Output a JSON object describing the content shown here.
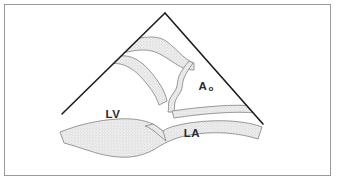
{
  "figure": {
    "kind": "echocardiogram-sector-schematic",
    "background_color": "#ffffff",
    "frame": {
      "border_color": "#9a9a9a",
      "border_width_px": 1,
      "x": 4,
      "y": 4,
      "width": 327,
      "height": 172
    }
  },
  "sector": {
    "name": "ultrasound-sector-outline",
    "stroke_color": "#1c1c1c",
    "stroke_width_px": 1.6,
    "apex": {
      "x": 165,
      "y": 13
    },
    "left_edge_end": {
      "x": 62,
      "y": 114
    },
    "right_edge_end": {
      "x": 263,
      "y": 124
    }
  },
  "tissue": {
    "fill_color": "#ececec",
    "stipple_dot_color": "#bdbdbd",
    "outline_color": "#888888",
    "outline_width_px": 0.9,
    "structures": [
      {
        "name": "interventricular-septum",
        "description": "upper stippled band running from left sector edge down toward the aortic root"
      },
      {
        "name": "aortic-root-posterior-wall",
        "description": "stippled band forming the lower boundary of the aorta and roof of the left atrium"
      },
      {
        "name": "mitral-valve-leaflet",
        "description": "wavy stippled strand between left ventricle and aorta"
      },
      {
        "name": "posterior-wall-band",
        "description": "broad stippled band sweeping across the bottom beneath the left ventricle and left atrium"
      }
    ]
  },
  "labels": {
    "left_ventricle": {
      "text": "LV",
      "name": "label-left-ventricle",
      "x": 113,
      "y": 118
    },
    "aorta": {
      "text": "A",
      "subscript": "o",
      "name": "label-aorta",
      "x": 203,
      "y": 90
    },
    "left_atrium": {
      "text": "LA",
      "name": "label-left-atrium",
      "x": 192,
      "y": 137
    }
  },
  "colors": {
    "ink": "#1c1c1c",
    "frame": "#9a9a9a",
    "tissue_fill": "#ececec",
    "tissue_outline": "#888888",
    "stipple": "#bdbdbd",
    "label_text": "#2b2b2b",
    "page": "#ffffff"
  }
}
